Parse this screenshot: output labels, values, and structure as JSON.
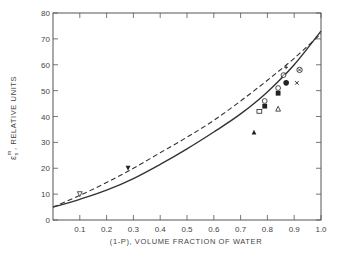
{
  "chart_data": {
    "type": "line",
    "title": "",
    "xlabel": "(1-P), VOLUME FRACTION OF WATER",
    "ylabel": "ε_s^m, RELATIVE UNITS",
    "ylabel_parts": {
      "symbol": "ε",
      "sub": "s",
      "sup": "m",
      "rest": ", RELATIVE UNITS"
    },
    "xlim": [
      0,
      1.0
    ],
    "ylim": [
      0,
      80
    ],
    "grid": false,
    "legend": null,
    "x_ticks": [
      "0.1",
      "0.2",
      "0.3",
      "0.4",
      "0.5",
      "0.6",
      "0.7",
      "0.8",
      "0.9",
      "1.0"
    ],
    "y_ticks": [
      "0",
      "10",
      "20",
      "30",
      "40",
      "50",
      "60",
      "70",
      "80"
    ],
    "series": [
      {
        "name": "solid-curve",
        "style": "solid",
        "x": [
          0.0,
          0.1,
          0.2,
          0.3,
          0.4,
          0.5,
          0.6,
          0.7,
          0.8,
          0.9,
          1.0
        ],
        "values": [
          5,
          8,
          11.5,
          16,
          21.5,
          27.5,
          34,
          41,
          49.5,
          60,
          73
        ]
      },
      {
        "name": "dashed-curve",
        "style": "dashed",
        "x": [
          0.0,
          0.1,
          0.2,
          0.3,
          0.4,
          0.5,
          0.6,
          0.7,
          0.8,
          0.9,
          1.0
        ],
        "values": [
          5,
          9.5,
          14.5,
          20,
          26,
          32,
          38.5,
          46,
          54,
          62.5,
          72
        ]
      }
    ],
    "points": [
      {
        "marker": "open-triangle-down",
        "x": 0.1,
        "y": 10
      },
      {
        "marker": "filled-triangle-down",
        "x": 0.28,
        "y": 20
      },
      {
        "marker": "filled-triangle",
        "x": 0.75,
        "y": 34
      },
      {
        "marker": "open-square",
        "x": 0.77,
        "y": 42
      },
      {
        "marker": "filled-square",
        "x": 0.79,
        "y": 44
      },
      {
        "marker": "open-circle",
        "x": 0.79,
        "y": 46
      },
      {
        "marker": "open-triangle",
        "x": 0.84,
        "y": 43
      },
      {
        "marker": "filled-square",
        "x": 0.84,
        "y": 49
      },
      {
        "marker": "open-circle",
        "x": 0.84,
        "y": 51
      },
      {
        "marker": "filled-circle",
        "x": 0.87,
        "y": 53
      },
      {
        "marker": "slashed-circle",
        "x": 0.86,
        "y": 56
      },
      {
        "marker": "cross",
        "x": 0.87,
        "y": 59
      },
      {
        "marker": "x",
        "x": 0.91,
        "y": 53
      },
      {
        "marker": "circled-x",
        "x": 0.92,
        "y": 58
      }
    ]
  }
}
